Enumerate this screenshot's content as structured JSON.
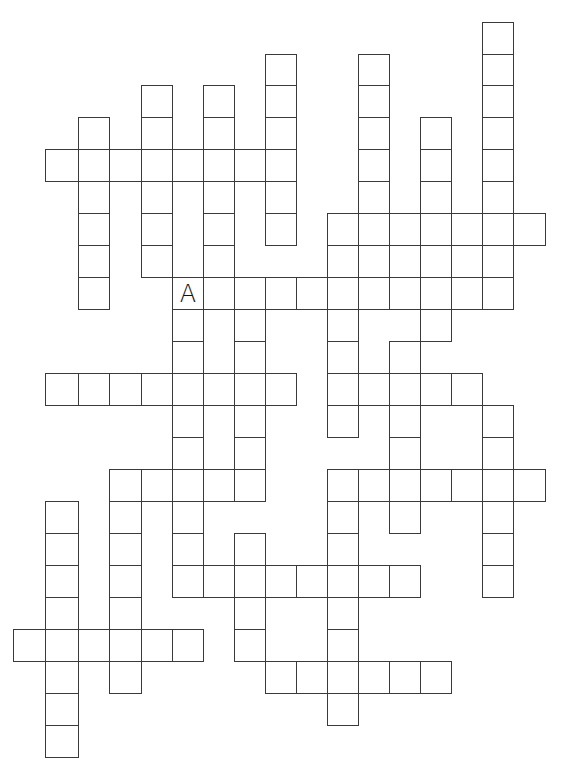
{
  "puzzle": {
    "type": "crossword",
    "line_color": "#3a3a3a",
    "background": "#ffffff",
    "col_x": [
      13,
      45,
      78,
      109,
      141,
      172,
      203,
      234,
      265,
      296,
      327,
      358,
      389,
      420,
      451,
      482,
      513,
      545
    ],
    "row_y": [
      22,
      54,
      85,
      117,
      149,
      181,
      213,
      245,
      277,
      309,
      341,
      373,
      405,
      437,
      469,
      501,
      533,
      565,
      597,
      629,
      661,
      693,
      725,
      757
    ],
    "across": [
      {
        "row": 4,
        "col": 1,
        "length": 8
      },
      {
        "row": 6,
        "col": 10,
        "length": 7
      },
      {
        "row": 7,
        "col": 10,
        "length": 6
      },
      {
        "row": 8,
        "col": 5,
        "length": 11
      },
      {
        "row": 11,
        "col": 1,
        "length": 8
      },
      {
        "row": 11,
        "col": 10,
        "length": 5
      },
      {
        "row": 14,
        "col": 3,
        "length": 5
      },
      {
        "row": 14,
        "col": 11,
        "length": 6
      },
      {
        "row": 17,
        "col": 5,
        "length": 8
      },
      {
        "row": 19,
        "col": 0,
        "length": 6
      },
      {
        "row": 20,
        "col": 8,
        "length": 6
      }
    ],
    "down": [
      {
        "col": 2,
        "row": 3,
        "length": 6
      },
      {
        "col": 4,
        "row": 2,
        "length": 6
      },
      {
        "col": 6,
        "row": 2,
        "length": 7
      },
      {
        "col": 8,
        "row": 1,
        "length": 6
      },
      {
        "col": 11,
        "row": 1,
        "length": 7
      },
      {
        "col": 13,
        "row": 3,
        "length": 7
      },
      {
        "col": 15,
        "row": 0,
        "length": 9
      },
      {
        "col": 10,
        "row": 6,
        "length": 7
      },
      {
        "col": 12,
        "row": 10,
        "length": 6
      },
      {
        "col": 5,
        "row": 8,
        "length": 10
      },
      {
        "col": 7,
        "row": 8,
        "length": 7
      },
      {
        "col": 15,
        "row": 12,
        "length": 6
      },
      {
        "col": 1,
        "row": 15,
        "length": 8
      },
      {
        "col": 3,
        "row": 14,
        "length": 7
      },
      {
        "col": 10,
        "row": 14,
        "length": 8
      },
      {
        "col": 7,
        "row": 16,
        "length": 4
      },
      {
        "col": 12,
        "row": 14,
        "length": 2
      }
    ],
    "filled_letters": [
      {
        "row": 8,
        "col": 5,
        "letter": "A"
      }
    ]
  }
}
